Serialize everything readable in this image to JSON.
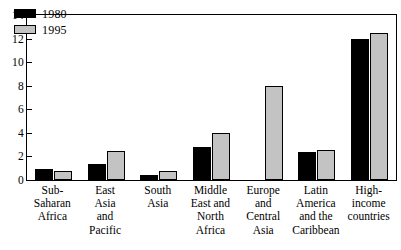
{
  "chart_data": {
    "type": "bar",
    "title": "",
    "subtitle": "",
    "xlabel": "",
    "ylabel": "",
    "ylim": [
      0,
      14
    ],
    "ytick_step": 2,
    "yticks": [
      0,
      2,
      4,
      6,
      8,
      10,
      12,
      14
    ],
    "ytick_labels": [
      "0",
      "2",
      "4",
      "6",
      "8",
      "10",
      "12",
      "14"
    ],
    "grid": false,
    "legend_position": "top-left",
    "categories": [
      "Sub-Saharan Africa",
      "East Asia and Pacific",
      "South Asia",
      "Middle East and North Africa",
      "Europe and Central Asia",
      "Latin America and the Caribbean",
      "High-income countries"
    ],
    "category_lines": [
      [
        "Sub-",
        "Saharan",
        "Africa"
      ],
      [
        "East",
        "Asia",
        "and",
        "Pacific"
      ],
      [
        "South",
        "Asia"
      ],
      [
        "Middle",
        "East and",
        "North",
        "Africa"
      ],
      [
        "Europe",
        "and",
        "Central",
        "Asia"
      ],
      [
        "Latin",
        "America",
        "and the",
        "Caribbean"
      ],
      [
        "High-",
        "income",
        "countries"
      ]
    ],
    "series": [
      {
        "name": "1980",
        "color": "#000000",
        "values": [
          0.9,
          1.4,
          0.4,
          2.8,
          0,
          2.4,
          12.0
        ]
      },
      {
        "name": "1995",
        "color": "#c3c3c3",
        "values": [
          0.75,
          2.45,
          0.8,
          4.0,
          8.0,
          2.55,
          12.5
        ]
      }
    ]
  },
  "legend": {
    "items": [
      {
        "label": "1980",
        "swatch": "black-swatch"
      },
      {
        "label": "1995",
        "swatch": "gray-swatch"
      }
    ]
  }
}
